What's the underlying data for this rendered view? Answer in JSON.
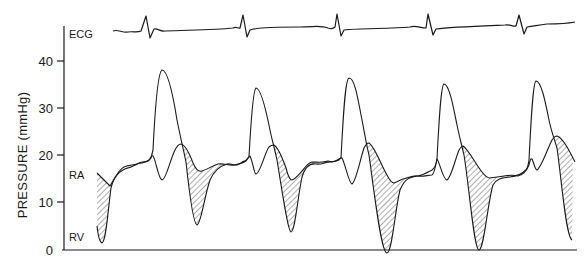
{
  "chart_data": {
    "type": "line",
    "title": "",
    "xlabel": "",
    "ylabel": "PRESSURE (mmHg)",
    "ylim": [
      0,
      45
    ],
    "yticks": [
      0,
      10,
      20,
      30,
      40
    ],
    "ytick_labels": [
      "0",
      "10",
      "20",
      "30",
      "40"
    ],
    "grid": false,
    "legend": "inline labels at left (ECG, RA, RV)",
    "traces": [
      "ECG",
      "RA",
      "RV"
    ],
    "shading": "hatched area between RA and RV where RA pressure exceeds RV pressure",
    "series": [
      {
        "name": "RV",
        "description": "Right ventricular pressure; 5 beats",
        "beats": [
          {
            "beat": 1,
            "systolic_peak": 38,
            "diastolic_min": 1.5
          },
          {
            "beat": 2,
            "systolic_peak": 34,
            "diastolic_min": 3.5
          },
          {
            "beat": 3,
            "systolic_peak": 36,
            "diastolic_min": -0.5
          },
          {
            "beat": 4,
            "systolic_peak": 35,
            "diastolic_min": 0
          },
          {
            "beat": 5,
            "systolic_peak": 36,
            "diastolic_min": 2
          }
        ],
        "end_diastolic_plateau": 17
      },
      {
        "name": "RA",
        "description": "Right atrial pressure; x-descent and v-wave per beat",
        "beats": [
          {
            "beat": 1,
            "v_wave_peak": 22,
            "y_descent_min": 16
          },
          {
            "beat": 2,
            "v_wave_peak": 22,
            "y_descent_min": 15
          },
          {
            "beat": 3,
            "v_wave_peak": 22.5,
            "y_descent_min": 14
          },
          {
            "beat": 4,
            "v_wave_peak": 22,
            "y_descent_min": 15
          },
          {
            "beat": 5,
            "v_wave_peak": 24,
            "y_descent_min": 18
          }
        ],
        "start_value": 16,
        "plateau": 18
      },
      {
        "name": "ECG",
        "description": "Electrocardiogram; 5 QRS complexes aligned with RV upstrokes"
      }
    ]
  },
  "labels": {
    "ylabel": "PRESSURE (mmHg)",
    "ecg": "ECG",
    "ra": "RA",
    "rv": "RV",
    "ticks": [
      "40",
      "30",
      "20",
      "10",
      "0"
    ]
  },
  "colors": {
    "line": "#1a1a1a",
    "background": "#ffffff"
  },
  "geometry": {
    "ecg": "M113,31 C118,29 122,33 128,32 C133,31 137,33 141,31 L146,16 L150,38 L154,29 C158,28 160,32 165,31 C190,30 215,30 233,28 C236,26 238,29 240,28 L243,15 L247,37 L250,30 C255,28 280,27 300,27 C315,27 320,25 328,28 C331,29 333,29 335,27 L337,14 L341,36 L344,30 C360,28 390,29 410,27 C416,25 420,28 426,28 L428,14 L433,35 L436,29 C450,27 480,26 505,25 C510,24 513,27 516,26 L519,15 L524,34 L527,27 C535,26 538,25 547,24 C560,24 570,23 575,22",
    "rv": "M97,226 C98,235 99,242 102,243 C106,242 108,210 111,188 C114,176 120,170 128,168 C133,167 137,163 142,163 C146,161 149,162 151,158 L153,150 C155,110 158,72 162,70 C168,70 173,95 177,120 C180,135 183,148 186,162 C189,190 193,224 197,225 C201,224 204,198 210,180 C214,171 220,166 227,164 C232,163 237,168 242,162 C246,161 247,160 249,157 C251,120 253,90 256,88 C261,88 266,110 270,130 C272,140 274,146 277,160 C282,190 288,232 291,232 C295,232 298,195 302,177 C305,167 310,163 316,164 C322,165 327,161 332,162 C336,161 338,160 341,158 C343,120 345,79 349,78 C355,78 358,100 362,120 C365,135 366,143 369,155 C374,190 381,253 387,253 C392,253 395,210 400,190 C405,178 410,177 418,176 C424,175 428,172 432,170 C435,168 436,165 437,159 C439,120 441,85 444,84 C449,84 453,105 457,125 C459,135 461,142 464,155 C469,185 474,250 479,250 C484,250 488,200 493,185 C497,178 503,178 510,177 C517,176 522,174 526,170 C528,168 528,165 529,160 C531,120 533,82 536,81 C541,81 545,100 549,120 C551,130 553,135 557,148 C561,175 566,238 572,240",
    "ra": "M97,173 C101,177 106,182 110,186 C114,180 118,170 124,167 C130,164 134,166 139,163 C143,161 146,163 149,160 C151,157 152,155 153,156 C156,160 158,178 162,180 C166,180 170,160 175,150 C177,146 179,144 181,144 C186,145 190,155 193,163 C196,170 199,172 202,171 C206,170 212,166 218,164 C224,163 229,166 234,165 C239,164 243,163 246,161 C248,158 249,156 250,156 C253,162 254,174 256,174 C260,174 265,152 269,147 C271,145 272,145 274,145 C279,148 283,160 286,168 C288,176 290,180 292,180 C296,179 300,173 303,170 C306,166 308,163 312,162 C318,162 323,163 328,161 C331,162 335,162 339,160 C341,158 341,157 342,158 C345,163 349,184 352,184 C356,182 360,160 364,148 C366,144 367,143 369,143 C375,147 381,165 387,175 C390,181 392,183 394,183 C397,182 400,180 403,179 C408,178 413,175 418,176 C423,177 428,175 432,175 C434,174 435,170 437,159 C440,163 443,180 447,180 C451,178 455,160 459,150 C461,147 462,146 463,146 C469,150 476,165 482,172 C485,176 487,178 490,178 C495,177 498,177 504,176 C510,175 514,175 518,176 C522,175 526,172 529,165 C530,160 531,158 532,159 C534,163 535,170 537,170 C541,168 547,150 552,140 C554,137 555,136 557,136 C563,138 569,150 575,162"
  }
}
